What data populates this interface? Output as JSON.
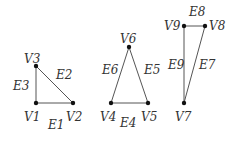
{
  "chart_data": {
    "type": "graph",
    "title": "",
    "components": [
      {
        "name": "triangle-1",
        "vertices": [
          {
            "id": "V1",
            "x": 36,
            "y": 103,
            "label": "V1",
            "lx": 24,
            "ly": 121
          },
          {
            "id": "V2",
            "x": 73,
            "y": 103,
            "label": "V2",
            "lx": 66,
            "ly": 121
          },
          {
            "id": "V3",
            "x": 36,
            "y": 66,
            "label": "V3",
            "lx": 24,
            "ly": 63
          }
        ],
        "edges": [
          {
            "id": "E1",
            "from": "V1",
            "to": "V2",
            "label": "E1",
            "lx": 48,
            "ly": 129
          },
          {
            "id": "E2",
            "from": "V2",
            "to": "V3",
            "label": "E2",
            "lx": 56,
            "ly": 79
          },
          {
            "id": "E3",
            "from": "V1",
            "to": "V3",
            "label": "E3",
            "lx": 13,
            "ly": 90
          }
        ]
      },
      {
        "name": "triangle-2",
        "vertices": [
          {
            "id": "V4",
            "x": 111,
            "y": 103,
            "label": "V4",
            "lx": 100,
            "ly": 121
          },
          {
            "id": "V5",
            "x": 148,
            "y": 103,
            "label": "V5",
            "lx": 141,
            "ly": 121
          },
          {
            "id": "V6",
            "x": 129,
            "y": 47,
            "label": "V6",
            "lx": 120,
            "ly": 43
          }
        ],
        "edges": [
          {
            "id": "E4",
            "from": "V4",
            "to": "V5",
            "label": "E4",
            "lx": 120,
            "ly": 127
          },
          {
            "id": "E5",
            "from": "V5",
            "to": "V6",
            "label": "E5",
            "lx": 144,
            "ly": 74
          },
          {
            "id": "E6",
            "from": "V4",
            "to": "V6",
            "label": "E6",
            "lx": 102,
            "ly": 74
          }
        ]
      },
      {
        "name": "triangle-3",
        "vertices": [
          {
            "id": "V7",
            "x": 184,
            "y": 103,
            "label": "V7",
            "lx": 175,
            "ly": 121
          },
          {
            "id": "V8",
            "x": 205,
            "y": 26,
            "label": "V8",
            "lx": 209,
            "ly": 30
          },
          {
            "id": "V9",
            "x": 184,
            "y": 26,
            "label": "V9",
            "lx": 164,
            "ly": 30
          }
        ],
        "edges": [
          {
            "id": "E7",
            "from": "V7",
            "to": "V8",
            "label": "E7",
            "lx": 199,
            "ly": 69
          },
          {
            "id": "E8",
            "from": "V9",
            "to": "V8",
            "label": "E8",
            "lx": 189,
            "ly": 16
          },
          {
            "id": "E9",
            "from": "V7",
            "to": "V9",
            "label": "E9",
            "lx": 168,
            "ly": 69
          }
        ]
      }
    ]
  }
}
